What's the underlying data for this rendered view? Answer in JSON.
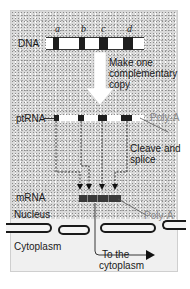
{
  "diagram": {
    "dna": {
      "label": "DNA",
      "exon_labels": [
        "a",
        "b",
        "c",
        "d"
      ]
    },
    "step_transcribe": {
      "text_line1": "Make one",
      "text_line2": "complementary",
      "text_line3": "copy"
    },
    "ptrna": {
      "label": "ptRNA",
      "tail_label": "Poly-A"
    },
    "step_splice": {
      "text_line1": "Cleave and",
      "text_line2": "splice"
    },
    "mrna": {
      "label": "mRNA",
      "tail_label": "Poly-A"
    },
    "regions": {
      "nucleus": "Nucleus",
      "cytoplasm": "Cytoplasm"
    },
    "export": {
      "text_line1": "To the",
      "text_line2": "cytoplasm"
    },
    "colors": {
      "exon": "#1e1e1e",
      "intron": "#ffffff",
      "nucleus_stipple": "#d9d9d9",
      "cytoplasm": "#f0f0f0",
      "poly_a_text": "#8a8a8a"
    }
  }
}
